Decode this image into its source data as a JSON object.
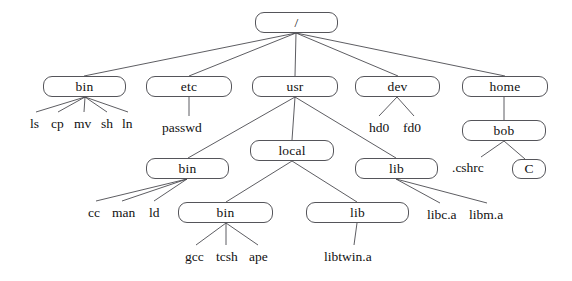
{
  "diagram": {
    "style": {
      "background": "#ffffff",
      "box_border": "#55555a",
      "box_fill": "#ffffff",
      "edge_color": "#4b4b50",
      "text_color": "#111111"
    },
    "nodes": [
      {
        "id": "root",
        "label": "/",
        "kind": "box",
        "x": 255,
        "y": 12,
        "w": 83,
        "h": 21
      },
      {
        "id": "bin",
        "label": "bin",
        "kind": "box",
        "x": 43,
        "y": 76,
        "w": 83,
        "h": 21
      },
      {
        "id": "etc",
        "label": "etc",
        "kind": "box",
        "x": 146,
        "y": 76,
        "w": 86,
        "h": 21
      },
      {
        "id": "usr",
        "label": "usr",
        "kind": "box",
        "x": 252,
        "y": 76,
        "w": 86,
        "h": 21
      },
      {
        "id": "dev",
        "label": "dev",
        "kind": "box",
        "x": 355,
        "y": 76,
        "w": 85,
        "h": 21
      },
      {
        "id": "home",
        "label": "home",
        "kind": "box",
        "x": 462,
        "y": 76,
        "w": 86,
        "h": 21
      },
      {
        "id": "bob",
        "label": "bob",
        "kind": "box",
        "x": 462,
        "y": 120,
        "w": 84,
        "h": 21
      },
      {
        "id": "local",
        "label": "local",
        "kind": "box",
        "x": 250,
        "y": 140,
        "w": 84,
        "h": 21
      },
      {
        "id": "usr-lib",
        "label": "lib",
        "kind": "box",
        "x": 355,
        "y": 158,
        "w": 83,
        "h": 21
      },
      {
        "id": "usr-bin",
        "label": "bin",
        "kind": "box",
        "x": 146,
        "y": 158,
        "w": 83,
        "h": 21
      },
      {
        "id": "c-dir",
        "label": "C",
        "kind": "box",
        "x": 512,
        "y": 159,
        "w": 34,
        "h": 20
      },
      {
        "id": "local-bin",
        "label": "bin",
        "kind": "box",
        "x": 178,
        "y": 202,
        "w": 95,
        "h": 21
      },
      {
        "id": "local-lib",
        "label": "lib",
        "kind": "box",
        "x": 306,
        "y": 202,
        "w": 103,
        "h": 21
      }
    ],
    "leaf_labels": [
      {
        "id": "leaf-ls",
        "label": "ls",
        "x": 30,
        "y": 117
      },
      {
        "id": "leaf-cp",
        "label": "cp",
        "x": 51,
        "y": 117
      },
      {
        "id": "leaf-mv",
        "label": "mv",
        "x": 74,
        "y": 117
      },
      {
        "id": "leaf-sh",
        "label": "sh",
        "x": 101,
        "y": 117
      },
      {
        "id": "leaf-ln",
        "label": "ln",
        "x": 122,
        "y": 117
      },
      {
        "id": "leaf-passwd",
        "label": "passwd",
        "x": 162,
        "y": 121
      },
      {
        "id": "leaf-hd0",
        "label": "hd0",
        "x": 369,
        "y": 121
      },
      {
        "id": "leaf-fd0",
        "label": "fd0",
        "x": 403,
        "y": 121
      },
      {
        "id": "leaf-cshrc",
        "label": ".cshrc",
        "x": 452,
        "y": 161
      },
      {
        "id": "leaf-cc",
        "label": "cc",
        "x": 88,
        "y": 206
      },
      {
        "id": "leaf-man",
        "label": "man",
        "x": 112,
        "y": 206
      },
      {
        "id": "leaf-ld",
        "label": "ld",
        "x": 149,
        "y": 206
      },
      {
        "id": "leaf-libc-a",
        "label": "libc.a",
        "x": 427,
        "y": 208
      },
      {
        "id": "leaf-libm-a",
        "label": "libm.a",
        "x": 469,
        "y": 208
      },
      {
        "id": "leaf-gcc",
        "label": "gcc",
        "x": 185,
        "y": 250
      },
      {
        "id": "leaf-tcsh",
        "label": "tcsh",
        "x": 216,
        "y": 250
      },
      {
        "id": "leaf-ape",
        "label": "ape",
        "x": 249,
        "y": 250
      },
      {
        "id": "leaf-libtwin-a",
        "label": "libtwin.a",
        "x": 324,
        "y": 250
      }
    ],
    "edges": [
      {
        "id": "root-bin",
        "from": "root",
        "to": "bin",
        "x1": 296,
        "y1": 33,
        "x2": 84,
        "y2": 76
      },
      {
        "id": "root-etc",
        "from": "root",
        "to": "etc",
        "x1": 296,
        "y1": 33,
        "x2": 189,
        "y2": 76
      },
      {
        "id": "root-usr",
        "from": "root",
        "to": "usr",
        "x1": 296,
        "y1": 33,
        "x2": 295,
        "y2": 76
      },
      {
        "id": "root-dev",
        "from": "root",
        "to": "dev",
        "x1": 296,
        "y1": 33,
        "x2": 398,
        "y2": 76
      },
      {
        "id": "root-home",
        "from": "root",
        "to": "home",
        "x1": 296,
        "y1": 33,
        "x2": 505,
        "y2": 76
      },
      {
        "id": "bin-ls",
        "from": "bin",
        "to": "leaf-ls",
        "x1": 85,
        "y1": 97,
        "x2": 36,
        "y2": 112
      },
      {
        "id": "bin-cp",
        "from": "bin",
        "to": "leaf-cp",
        "x1": 85,
        "y1": 97,
        "x2": 58,
        "y2": 112
      },
      {
        "id": "bin-mv",
        "from": "bin",
        "to": "leaf-mv",
        "x1": 85,
        "y1": 97,
        "x2": 84,
        "y2": 112
      },
      {
        "id": "bin-sh",
        "from": "bin",
        "to": "leaf-sh",
        "x1": 85,
        "y1": 97,
        "x2": 107,
        "y2": 112
      },
      {
        "id": "bin-ln",
        "from": "bin",
        "to": "leaf-ln",
        "x1": 85,
        "y1": 97,
        "x2": 128,
        "y2": 112
      },
      {
        "id": "etc-passwd",
        "from": "etc",
        "to": "leaf-passwd",
        "x1": 189,
        "y1": 97,
        "x2": 189,
        "y2": 116
      },
      {
        "id": "usr-usrbin",
        "from": "usr",
        "to": "usr-bin",
        "x1": 295,
        "y1": 97,
        "x2": 188,
        "y2": 158
      },
      {
        "id": "usr-local",
        "from": "usr",
        "to": "local",
        "x1": 295,
        "y1": 97,
        "x2": 292,
        "y2": 140
      },
      {
        "id": "usr-usrlib",
        "from": "usr",
        "to": "usr-lib",
        "x1": 295,
        "y1": 97,
        "x2": 396,
        "y2": 158
      },
      {
        "id": "dev-hd0",
        "from": "dev",
        "to": "leaf-hd0",
        "x1": 397,
        "y1": 97,
        "x2": 379,
        "y2": 116
      },
      {
        "id": "dev-fd0",
        "from": "dev",
        "to": "leaf-fd0",
        "x1": 397,
        "y1": 97,
        "x2": 414,
        "y2": 116
      },
      {
        "id": "home-bob",
        "from": "home",
        "to": "bob",
        "x1": 504,
        "y1": 97,
        "x2": 504,
        "y2": 120
      },
      {
        "id": "bob-cshrc",
        "from": "bob",
        "to": "leaf-cshrc",
        "x1": 504,
        "y1": 141,
        "x2": 481,
        "y2": 157
      },
      {
        "id": "bob-c",
        "from": "bob",
        "to": "c-dir",
        "x1": 504,
        "y1": 141,
        "x2": 525,
        "y2": 159
      },
      {
        "id": "usrbin-cc",
        "from": "usr-bin",
        "to": "leaf-cc",
        "x1": 187,
        "y1": 179,
        "x2": 96,
        "y2": 201
      },
      {
        "id": "usrbin-man",
        "from": "usr-bin",
        "to": "leaf-man",
        "x1": 187,
        "y1": 179,
        "x2": 122,
        "y2": 201
      },
      {
        "id": "usrbin-ld",
        "from": "usr-bin",
        "to": "leaf-ld",
        "x1": 187,
        "y1": 179,
        "x2": 154,
        "y2": 201
      },
      {
        "id": "local-localbin",
        "from": "local",
        "to": "local-bin",
        "x1": 292,
        "y1": 161,
        "x2": 226,
        "y2": 202
      },
      {
        "id": "local-locallib",
        "from": "local",
        "to": "local-lib",
        "x1": 292,
        "y1": 161,
        "x2": 357,
        "y2": 202
      },
      {
        "id": "usrlib-libc",
        "from": "usr-lib",
        "to": "leaf-libc-a",
        "x1": 396,
        "y1": 179,
        "x2": 440,
        "y2": 203
      },
      {
        "id": "usrlib-libm",
        "from": "usr-lib",
        "to": "leaf-libm-a",
        "x1": 396,
        "y1": 179,
        "x2": 487,
        "y2": 203
      },
      {
        "id": "localbin-gcc",
        "from": "local-bin",
        "to": "leaf-gcc",
        "x1": 226,
        "y1": 223,
        "x2": 196,
        "y2": 245
      },
      {
        "id": "localbin-tcsh",
        "from": "local-bin",
        "to": "leaf-tcsh",
        "x1": 226,
        "y1": 223,
        "x2": 226,
        "y2": 245
      },
      {
        "id": "localbin-ape",
        "from": "local-bin",
        "to": "leaf-ape",
        "x1": 226,
        "y1": 223,
        "x2": 258,
        "y2": 245
      },
      {
        "id": "locallib-libtwin",
        "from": "local-lib",
        "to": "leaf-libtwin-a",
        "x1": 357,
        "y1": 223,
        "x2": 354,
        "y2": 245
      }
    ]
  }
}
